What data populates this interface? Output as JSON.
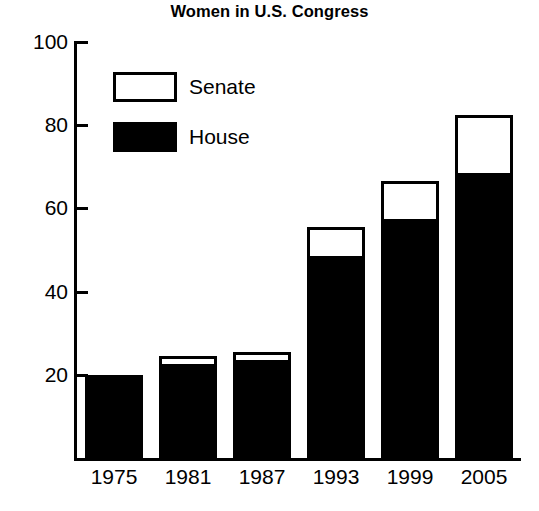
{
  "chart_data": {
    "type": "bar",
    "title": "Women in U.S. Congress",
    "xlabel": "",
    "ylabel": "",
    "categories": [
      "1975",
      "1981",
      "1987",
      "1993",
      "1999",
      "2005"
    ],
    "series": [
      {
        "name": "House",
        "values": [
          20,
          22,
          23,
          48,
          57,
          68
        ],
        "color": "#000000"
      },
      {
        "name": "Senate",
        "values": [
          0,
          2,
          2,
          7,
          9,
          14
        ],
        "color": "#ffffff"
      }
    ],
    "totals": [
      20,
      24,
      25,
      55,
      66,
      82
    ],
    "stacked": true,
    "ylim": [
      0,
      100
    ],
    "yticks": [
      20,
      40,
      60,
      80,
      100
    ],
    "ytick_labels": [
      "20",
      "40",
      "60",
      "80",
      "100"
    ],
    "grid": false,
    "legend_position": "upper-left-inside",
    "legend": [
      {
        "label": "Senate",
        "swatch": "hollow"
      },
      {
        "label": "House",
        "swatch": "filled"
      }
    ]
  }
}
